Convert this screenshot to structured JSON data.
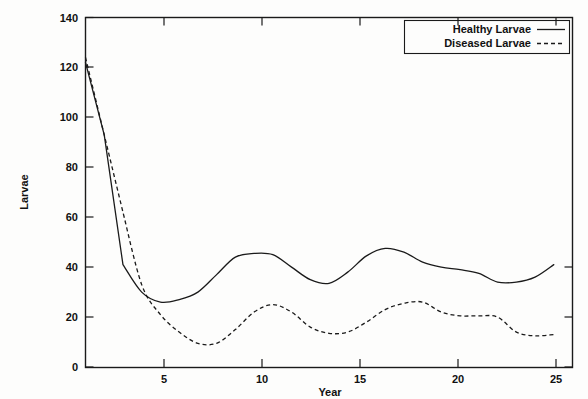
{
  "chart_data": {
    "type": "line",
    "title": "",
    "xlabel": "Year",
    "ylabel": "Larvae",
    "xlim": [
      0,
      26
    ],
    "ylim": [
      0,
      140
    ],
    "grid": false,
    "legend_position": "top-right",
    "xticks": [
      5,
      10,
      15,
      20,
      25
    ],
    "yticks": [
      0,
      20,
      40,
      60,
      80,
      100,
      120,
      140
    ],
    "x": [
      0,
      1,
      2,
      3,
      4,
      5,
      6,
      7,
      8,
      9,
      10,
      11,
      12,
      13,
      14,
      15,
      16,
      17,
      18,
      19,
      20,
      21,
      22,
      23,
      24,
      25
    ],
    "series": [
      {
        "name": "Healthy Larvae",
        "style": "solid",
        "values": [
          122,
          93,
          41,
          30,
          26,
          27,
          30,
          37,
          44,
          45.5,
          45,
          40,
          35,
          33.5,
          38,
          44.5,
          47.5,
          46,
          42,
          40,
          39,
          37.5,
          34,
          34,
          36,
          41
        ]
      },
      {
        "name": "Diseased Larvae",
        "style": "dashed",
        "values": [
          124,
          93,
          62,
          33,
          21,
          14,
          9.5,
          9.5,
          15,
          22,
          25,
          22,
          16,
          13.5,
          14,
          18,
          23,
          25.5,
          26,
          22,
          20.5,
          20.5,
          20,
          14,
          12.5,
          13
        ]
      }
    ]
  },
  "axes": {
    "ylabel": "Larvae",
    "xlabel": "Year",
    "ytick_labels": [
      "0",
      "20",
      "40",
      "60",
      "80",
      "100",
      "120",
      "140"
    ],
    "xtick_labels": [
      "5",
      "10",
      "15",
      "20",
      "25"
    ]
  },
  "legend": {
    "entries": [
      {
        "label": "Healthy Larvae",
        "style": "solid"
      },
      {
        "label": "Diseased Larvae",
        "style": "dashed"
      }
    ]
  },
  "colors": {
    "ink": "#1a1a1a",
    "background": "#fdfdfc"
  }
}
